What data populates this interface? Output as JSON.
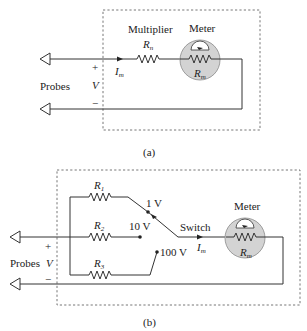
{
  "figure_a": {
    "caption": "(a)",
    "multiplier_label": "Multiplier",
    "rn_label": "R",
    "rn_sub": "n",
    "meter_label": "Meter",
    "rm_label": "R",
    "rm_sub": "m",
    "current_label": "I",
    "current_sub": "m",
    "probes_label": "Probes",
    "plus": "+",
    "voltage_label": "V",
    "minus": "−"
  },
  "figure_b": {
    "caption": "(b)",
    "r1_label": "R",
    "r1_sub": "1",
    "r2_label": "R",
    "r2_sub": "2",
    "r3_label": "R",
    "r3_sub": "3",
    "range_1v": "1 V",
    "range_10v": "10 V",
    "range_100v": "100 V",
    "switch_label": "Switch",
    "meter_label": "Meter",
    "rm_label": "R",
    "rm_sub": "m",
    "current_label": "I",
    "current_sub": "m",
    "probes_label": "Probes",
    "plus": "+",
    "voltage_label": "V",
    "minus": "−"
  }
}
